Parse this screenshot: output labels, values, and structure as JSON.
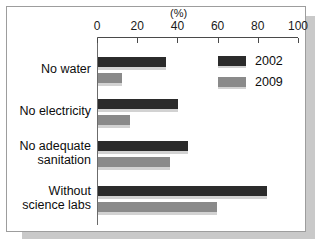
{
  "chart_data": {
    "type": "bar",
    "orientation": "horizontal",
    "title": "",
    "subtitle": "",
    "unit_label": "(%)",
    "xlabel": "",
    "ylabel": "",
    "xlim": [
      0,
      100
    ],
    "xticks": [
      0,
      20,
      40,
      60,
      80,
      100
    ],
    "xtick_labels": [
      "0",
      "20",
      "40",
      "60",
      "80",
      "100"
    ],
    "grid": false,
    "legend_position": "top-right",
    "categories": [
      "No water",
      "No electricity",
      "No adequate sanitation",
      "Without science labs"
    ],
    "category_label_lines": [
      [
        "No water"
      ],
      [
        "No electricity"
      ],
      [
        "No adequate",
        "sanitation"
      ],
      [
        "Without",
        "science labs"
      ]
    ],
    "series": [
      {
        "name": "2002",
        "color": "#2b2b2b",
        "values": [
          34,
          40,
          45,
          84
        ]
      },
      {
        "name": "2009",
        "color": "#8a8a8a",
        "values": [
          12,
          16,
          36,
          59
        ]
      }
    ]
  },
  "legend": {
    "entries": [
      {
        "label": "2002",
        "swatch": "dark"
      },
      {
        "label": "2009",
        "swatch": "gray"
      }
    ]
  },
  "axis": {
    "unit": "(%)",
    "ticks": [
      {
        "value": "0"
      },
      {
        "value": "20"
      },
      {
        "value": "40"
      },
      {
        "value": "60"
      },
      {
        "value": "80"
      },
      {
        "value": "100"
      }
    ]
  }
}
